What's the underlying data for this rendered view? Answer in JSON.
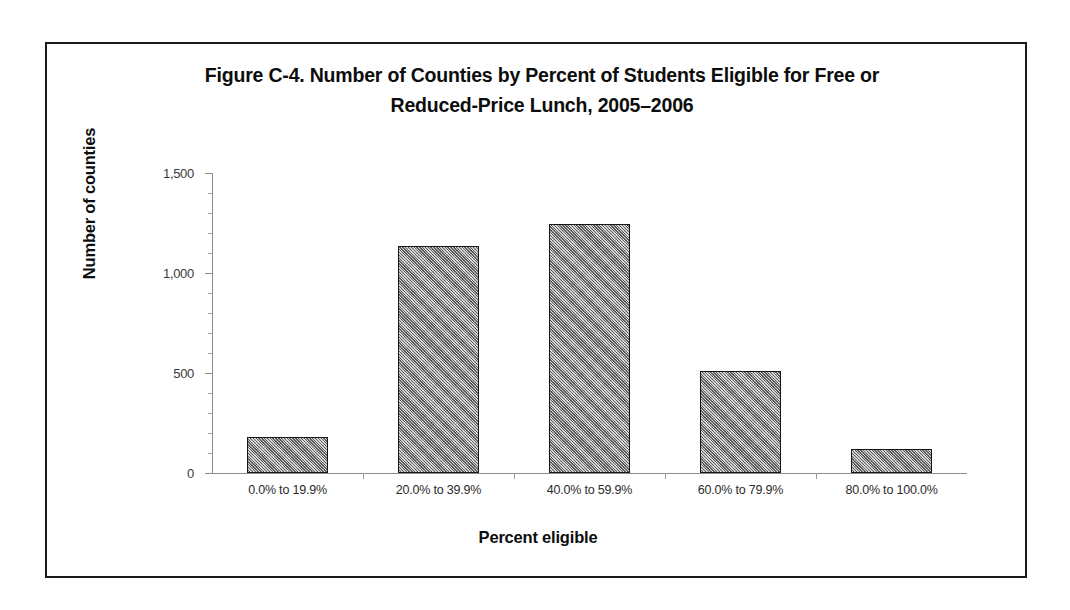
{
  "figure": {
    "title_line1": "Figure C-4. Number of Counties by Percent of Students Eligible for Free or",
    "title_line2": "Reduced-Price Lunch, 2005–2006",
    "title_full": "Figure C-4. Number of Counties by Percent of Students Eligible for Free or Reduced-Price Lunch, 2005–2006"
  },
  "chart_data": {
    "type": "bar",
    "title": "Figure C-4. Number of Counties by Percent of Students Eligible for Free or Reduced-Price Lunch, 2005–2006",
    "xlabel": "Percent eligible",
    "ylabel": "Number of counties",
    "categories": [
      "0.0% to 19.9%",
      "20.0% to 39.9%",
      "40.0% to 59.9%",
      "60.0% to 79.9%",
      "80.0% to 100.0%"
    ],
    "values": [
      180,
      1135,
      1245,
      510,
      120
    ],
    "ylim": [
      0,
      1500
    ],
    "ytick_values": [
      0,
      500,
      1000,
      1500
    ],
    "ytick_labels": [
      "0",
      "500",
      "1,000",
      "1,500"
    ],
    "yminor_step": 100,
    "grid": false,
    "legend": null,
    "bar_fill_color": "#9e9e9e",
    "bar_edge_color": "#171717",
    "axis_color": "#8c8c8c",
    "frame_color": "#1a1a1a"
  }
}
